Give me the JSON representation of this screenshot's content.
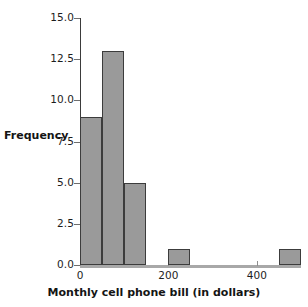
{
  "chart_data": {
    "type": "bar",
    "title": "",
    "xlabel": "Monthly cell phone bill (in dollars)",
    "ylabel": "Frequency",
    "bin_width": 50,
    "bin_starts": [
      0,
      50,
      100,
      150,
      200,
      250,
      300,
      350,
      400,
      450
    ],
    "categories": [
      "0-50",
      "50-100",
      "100-150",
      "150-200",
      "200-250",
      "250-300",
      "300-350",
      "350-400",
      "400-450",
      "450-500"
    ],
    "values": [
      9,
      13,
      5,
      0,
      1,
      0,
      0,
      0,
      0,
      1
    ],
    "xlim": [
      0,
      500
    ],
    "ylim": [
      0,
      15
    ],
    "xticks": [
      0,
      200,
      400
    ],
    "xtick_labels": [
      "0",
      "200",
      "400"
    ],
    "yticks": [
      0.0,
      2.5,
      5.0,
      7.5,
      10.0,
      12.5,
      15.0
    ],
    "ytick_labels": [
      "0.0",
      "2.5",
      "5.0",
      "7.5",
      "10.0",
      "12.5",
      "15.0"
    ],
    "grid": false,
    "legend": false,
    "bar_color": "#9a9a9a",
    "bar_edge_color": "#3c3c3c",
    "axis_color": "#3b3b3b"
  }
}
